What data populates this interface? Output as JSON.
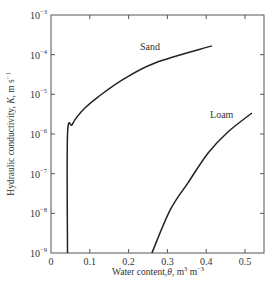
{
  "chart_data": {
    "type": "line",
    "title": "",
    "xlabel": "Water content, θ, m³ m⁻³",
    "ylabel": "Hydraulic conductivity, K, m s⁻¹",
    "xlim": [
      0,
      0.55
    ],
    "ylim": [
      1e-09,
      0.001
    ],
    "yscale": "log",
    "grid": false,
    "legend": "inline labels",
    "x_ticks": [
      0,
      0.1,
      0.2,
      0.3,
      0.4,
      0.5
    ],
    "x_tick_labels": [
      "0",
      "0.1",
      "0.2",
      "0.3",
      "0.4",
      "0.5"
    ],
    "y_ticks": [
      1e-09,
      1e-08,
      1e-07,
      1e-06,
      1e-05,
      0.0001,
      0.001
    ],
    "y_tick_labels": [
      {
        "base": "10",
        "exp": "−9"
      },
      {
        "base": "10",
        "exp": "−8"
      },
      {
        "base": "10",
        "exp": "−7"
      },
      {
        "base": "10",
        "exp": "−6"
      },
      {
        "base": "10",
        "exp": "−5"
      },
      {
        "base": "10",
        "exp": "−4"
      },
      {
        "base": "10",
        "exp": "−3"
      }
    ],
    "series": [
      {
        "name": "Sand",
        "label_pos": {
          "theta": 0.255,
          "log10K": -3.88
        },
        "x": [
          0.0425,
          0.0425,
          0.054,
          0.067,
          0.088,
          0.121,
          0.183,
          0.268,
          0.415
        ],
        "log10K": [
          -9.0,
          -6.02,
          -5.77,
          -5.57,
          -5.34,
          -5.07,
          -4.64,
          -4.21,
          -3.78
        ],
        "values": [
          1e-09,
          9.5e-07,
          1.7e-06,
          2.7e-06,
          4.6e-06,
          8.5e-06,
          2.3e-05,
          6.2e-05,
          0.00017
        ]
      },
      {
        "name": "Loam",
        "label_pos": {
          "theta": 0.44,
          "log10K": -5.6
        },
        "x": [
          0.26,
          0.307,
          0.353,
          0.405,
          0.456,
          0.518
        ],
        "log10K": [
          -9.0,
          -7.92,
          -7.23,
          -6.48,
          -5.95,
          -5.47
        ],
        "values": [
          1e-09,
          1.2e-08,
          5.9e-08,
          3.3e-07,
          1.1e-06,
          3.4e-06
        ]
      }
    ]
  },
  "labels": {
    "xlabel_main": "Water content,",
    "xlabel_symbol": "θ",
    "xlabel_units": ", m",
    "xlabel_sup1": "3",
    "xlabel_units2": " m",
    "xlabel_sup2": "−3",
    "ylabel_main": "Hydraulic conductivity, ",
    "ylabel_symbol": "K",
    "ylabel_units": ", m s",
    "ylabel_sup": "−1"
  }
}
